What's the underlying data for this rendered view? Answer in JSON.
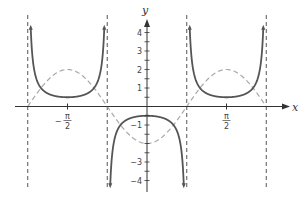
{
  "chart_data": {
    "type": "line",
    "title": "",
    "xlabel": "x",
    "ylabel": "y",
    "xlim": [
      -2.72,
      3.07
    ],
    "ylim": [
      -4.4,
      4.6
    ],
    "grid": false,
    "legend": null,
    "x_ticks": [
      {
        "value": -1.5708,
        "label_num": "π",
        "label_den": "2",
        "sign": "−"
      },
      {
        "value": 1.5708,
        "label_num": "π",
        "label_den": "2",
        "sign": ""
      }
    ],
    "y_ticks": [
      {
        "value": 4,
        "label": "4"
      },
      {
        "value": 3,
        "label": "3"
      },
      {
        "value": 2,
        "label": "2"
      },
      {
        "value": 1,
        "label": "1"
      },
      {
        "value": -1,
        "label": "−1"
      },
      {
        "value": -3,
        "label": "−3"
      },
      {
        "value": -4,
        "label": "−4"
      }
    ],
    "y_minor_step": 0.5,
    "asymptotes_x": [
      -2.3562,
      -0.7854,
      0.7854,
      2.3562
    ],
    "series": [
      {
        "name": "y = -1/2 sec(2x)",
        "style": "solid",
        "color": "#555555",
        "samples": [
          [
            -1.5708,
            0.5
          ],
          [
            -1.1781,
            0.707
          ],
          [
            -1.9635,
            0.707
          ],
          [
            0,
            -0.5
          ],
          [
            0.3927,
            -0.707
          ],
          [
            -0.3927,
            -0.707
          ],
          [
            1.5708,
            0.5
          ]
        ]
      },
      {
        "name": "y = -2 cos(2x)",
        "style": "dashed",
        "color": "#aaaaaa",
        "samples": [
          [
            -2.3562,
            0
          ],
          [
            -1.5708,
            2
          ],
          [
            -0.7854,
            0
          ],
          [
            0,
            -2
          ],
          [
            0.7854,
            0
          ],
          [
            1.5708,
            2
          ],
          [
            2.3562,
            0
          ]
        ]
      }
    ]
  },
  "labels": {
    "x_axis": "x",
    "y_axis": "y",
    "neg_half_pi_sign": "−",
    "pi": "π",
    "two": "2"
  },
  "colors": {
    "axis": "#333333",
    "solid_curve": "#555555",
    "dashed_curve": "#aaaaaa",
    "asymptote": "#555555"
  }
}
